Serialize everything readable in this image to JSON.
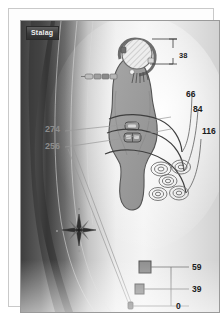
{
  "figure": {
    "title": "Stalag",
    "caption_plate_visible": true
  },
  "labels": {
    "dim_top": "38",
    "contour_66": "66",
    "contour_84": "84",
    "contour_116": "116",
    "left_274": "274",
    "left_256": "256",
    "scale_59": "59",
    "scale_39": "39",
    "scale_0": "0"
  },
  "colors": {
    "background": "#f2f2f2",
    "dark_band": "#4a4a4a",
    "body_fill": "#9b9b9b",
    "body_stroke": "#5a5a5a",
    "label_dark": "#1b1b1b",
    "label_gray": "#8d8d8d",
    "frame": "#9a9a9a",
    "marker_fill": "#8e8e8e"
  },
  "icons": {
    "compass": "compass-rose-icon",
    "hatched_circle": "hatched-circle-icon",
    "ring_cluster": "concentric-ring-icon",
    "square_marker": "square-marker-icon",
    "point_marker": "point-marker-icon"
  }
}
